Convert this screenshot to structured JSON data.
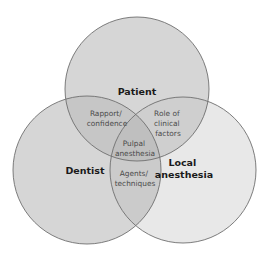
{
  "diagram": {
    "type": "venn",
    "sets": [
      {
        "id": "patient",
        "label_lines": [
          "Patient"
        ],
        "fill": "#d6d6d6"
      },
      {
        "id": "dentist",
        "label_lines": [
          "Dentist"
        ],
        "fill": "#d6d6d6"
      },
      {
        "id": "local",
        "label_lines": [
          "Local",
          "anesthesia"
        ],
        "fill": "#e8e8e8"
      }
    ],
    "intersections": [
      {
        "sets": [
          "patient",
          "dentist"
        ],
        "label_lines": [
          "Rapport/",
          "confidence"
        ]
      },
      {
        "sets": [
          "patient",
          "local"
        ],
        "label_lines": [
          "Role of",
          "clinical",
          "factors"
        ]
      },
      {
        "sets": [
          "dentist",
          "local"
        ],
        "label_lines": [
          "Agents/",
          "techniques"
        ]
      },
      {
        "sets": [
          "patient",
          "dentist",
          "local"
        ],
        "label_lines": [
          "Pulpal",
          "anesthesia"
        ]
      }
    ],
    "stroke": "#6e6e6e"
  }
}
